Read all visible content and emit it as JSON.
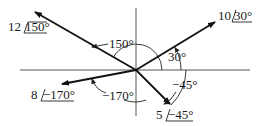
{
  "diagram": {
    "type": "phasor-diagram",
    "origin": {
      "x": 136,
      "y": 70
    },
    "axes": {
      "horizontal": {
        "x1": 20,
        "x2": 250
      },
      "vertical": {
        "y1": 8,
        "y2": 116
      }
    },
    "phasors": [
      {
        "id": "p1",
        "magnitude": "12",
        "angle": "150°",
        "magnitude_label": "12",
        "angle_label": "150°",
        "tip": {
          "x": 35,
          "y": 12
        }
      },
      {
        "id": "p2",
        "magnitude": "10",
        "angle": "30°",
        "magnitude_label": "10",
        "angle_label": "30°",
        "tip": {
          "x": 215,
          "y": 22
        }
      },
      {
        "id": "p3",
        "magnitude": "8",
        "angle": "−170°",
        "magnitude_label": "8",
        "angle_label": "−170°",
        "tip": {
          "x": 62,
          "y": 84
        }
      },
      {
        "id": "p4",
        "magnitude": "5",
        "angle": "−45°",
        "magnitude_label": "5",
        "angle_label": "−45°",
        "tip": {
          "x": 170,
          "y": 104
        }
      }
    ],
    "angle_annotations": [
      {
        "id": "a150",
        "text": "150°"
      },
      {
        "id": "a30",
        "text": "30°"
      },
      {
        "id": "a-45",
        "text": "−45°"
      },
      {
        "id": "a-170",
        "text": "−170°"
      }
    ],
    "colors": {
      "line": "#111111",
      "axis": "#555555",
      "background": "#ffffff"
    }
  }
}
